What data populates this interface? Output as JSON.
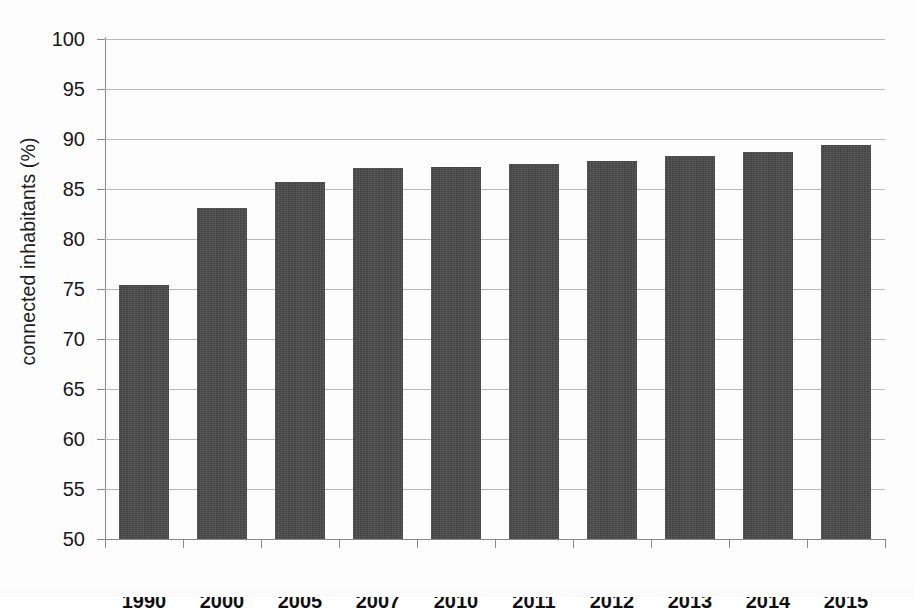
{
  "chart_data": {
    "type": "bar",
    "title": "",
    "xlabel": "",
    "ylabel": "connected inhabitants (%)",
    "categories": [
      "1990",
      "2000",
      "2005",
      "2007",
      "2010",
      "2011",
      "2012",
      "2013",
      "2014",
      "2015"
    ],
    "values": [
      75.4,
      83.1,
      85.7,
      87.1,
      87.2,
      87.5,
      87.8,
      88.3,
      88.7,
      89.4
    ],
    "ylim": [
      50,
      100
    ],
    "yticks": [
      50,
      55,
      60,
      65,
      70,
      75,
      80,
      85,
      90,
      95,
      100
    ],
    "ytick_labels": [
      "50",
      "55",
      "60",
      "65",
      "70",
      "75",
      "80",
      "85",
      "90",
      "95",
      "100"
    ],
    "grid": true,
    "legend": "none",
    "series": [
      {
        "name": "connected inhabitants",
        "values": [
          75.4,
          83.1,
          85.7,
          87.1,
          87.2,
          87.5,
          87.8,
          88.3,
          88.7,
          89.4
        ]
      }
    ],
    "bar_color": "#4b4b4b",
    "gridline_color": "#b9b9b9",
    "axis_color": "#8a8a8a",
    "background_color": "#fdfdfd"
  }
}
